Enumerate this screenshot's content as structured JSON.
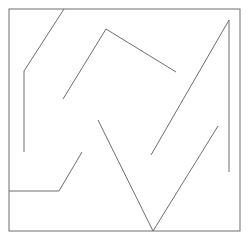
{
  "document": {
    "title": "Abstract Line Drawing",
    "width": 248,
    "height": 249,
    "background_color": "#ffffff"
  },
  "chart_data": {
    "type": "line",
    "subtitle": "",
    "xlabel": "",
    "ylabel": "",
    "xlim": [
      0,
      248
    ],
    "ylim": [
      0,
      249
    ],
    "grid": false,
    "legend": "none",
    "annotations": [],
    "tick_labels": {
      "x": [],
      "y": []
    },
    "stroke_color": "#6e6e6e",
    "stroke_width": 1,
    "frame": {
      "name": "border-frame",
      "color": "#6e6e6e",
      "width": 1,
      "x": 9,
      "y": 9,
      "w": 231,
      "h": 222
    },
    "series": [
      {
        "name": "left-zigzag-path",
        "color": "#6e6e6e",
        "points": [
          [
            64,
            9
          ],
          [
            24,
            71
          ],
          [
            24,
            152
          ]
        ]
      },
      {
        "name": "lower-left-step-path",
        "color": "#6e6e6e",
        "points": [
          [
            9,
            191
          ],
          [
            59,
            191
          ],
          [
            82,
            152
          ]
        ]
      },
      {
        "name": "upper-peak-path",
        "color": "#6e6e6e",
        "points": [
          [
            63,
            99
          ],
          [
            106,
            29
          ],
          [
            176,
            72
          ]
        ]
      },
      {
        "name": "center-vee-path",
        "color": "#6e6e6e",
        "points": [
          [
            98,
            120
          ],
          [
            153,
            231
          ],
          [
            218,
            126
          ]
        ]
      },
      {
        "name": "right-ascending-flag-path",
        "color": "#6e6e6e",
        "points": [
          [
            151,
            155
          ],
          [
            229,
            20
          ],
          [
            229,
            172
          ]
        ]
      }
    ]
  }
}
